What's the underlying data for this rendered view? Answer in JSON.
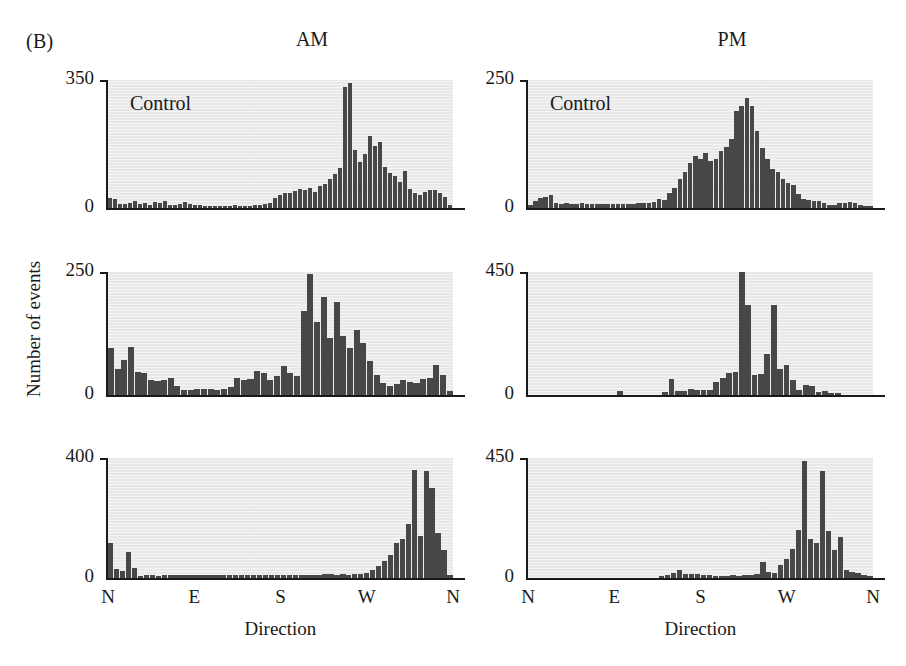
{
  "figure": {
    "panel_letter": "(B)",
    "y_axis_group_label": "Number of events",
    "columns": [
      {
        "id": "am",
        "label": "AM"
      },
      {
        "id": "pm",
        "label": "PM"
      }
    ]
  },
  "chart_data": [
    {
      "id": "am-control",
      "type": "bar",
      "title": "AM",
      "annotation": "Control",
      "xlabel": "Direction",
      "ylabel": "Number of events",
      "ylim": [
        0,
        350
      ],
      "ytick_labels": [
        "0",
        "350"
      ],
      "xtick_labels": [
        "N",
        "E",
        "S",
        "W",
        "N"
      ],
      "grid": false,
      "legend": "none",
      "categories": [
        "N",
        "",
        "",
        "",
        "",
        "",
        "",
        "",
        "E",
        "",
        "",
        "",
        "",
        "",
        "",
        "",
        "S",
        "",
        "",
        "",
        "",
        "",
        "",
        "",
        "W",
        "",
        "",
        "",
        "",
        "",
        "",
        "",
        "N"
      ],
      "values": [
        28,
        26,
        12,
        10,
        14,
        18,
        10,
        13,
        9,
        16,
        14,
        20,
        9,
        8,
        12,
        16,
        11,
        8,
        7,
        6,
        5,
        5,
        5,
        6,
        6,
        7,
        6,
        5,
        6,
        7,
        8,
        10,
        14,
        28,
        36,
        40,
        42,
        46,
        52,
        48,
        56,
        44,
        60,
        66,
        78,
        92,
        110,
        330,
        342,
        160,
        126,
        148,
        196,
        170,
        180,
        112,
        96,
        88,
        70,
        100,
        52,
        40,
        36,
        44,
        50,
        48,
        42,
        30,
        8
      ]
    },
    {
      "id": "pm-control",
      "type": "bar",
      "title": "PM",
      "annotation": "Control",
      "xlabel": "Direction",
      "ylabel": "Number of events",
      "ylim": [
        0,
        250
      ],
      "ytick_labels": [
        "0",
        "250"
      ],
      "xtick_labels": [
        "N",
        "E",
        "S",
        "W",
        "N"
      ],
      "grid": false,
      "legend": "none",
      "categories": [
        "N",
        "",
        "",
        "",
        "",
        "",
        "",
        "",
        "E",
        "",
        "",
        "",
        "",
        "",
        "",
        "",
        "S",
        "",
        "",
        "",
        "",
        "",
        "",
        "",
        "W",
        "",
        "",
        "",
        "",
        "",
        "",
        "",
        "N"
      ],
      "values": [
        6,
        14,
        20,
        22,
        26,
        10,
        8,
        9,
        8,
        8,
        9,
        8,
        7,
        8,
        7,
        8,
        8,
        7,
        8,
        8,
        8,
        9,
        10,
        10,
        12,
        18,
        16,
        30,
        40,
        56,
        70,
        88,
        102,
        96,
        108,
        92,
        96,
        112,
        120,
        134,
        190,
        200,
        215,
        200,
        150,
        118,
        96,
        76,
        70,
        56,
        48,
        44,
        28,
        18,
        16,
        14,
        13,
        10,
        6,
        5,
        10,
        9,
        12,
        10,
        5,
        4,
        3
      ]
    },
    {
      "id": "am-row2",
      "type": "bar",
      "title": "",
      "annotation": "",
      "xlabel": "Direction",
      "ylabel": "Number of events",
      "ylim": [
        0,
        250
      ],
      "ytick_labels": [
        "0",
        "250"
      ],
      "xtick_labels": [
        "N",
        "E",
        "S",
        "W",
        "N"
      ],
      "grid": false,
      "legend": "none",
      "categories": [
        "N",
        "",
        "",
        "",
        "",
        "",
        "",
        "",
        "E",
        "",
        "",
        "",
        "",
        "",
        "",
        "",
        "S",
        "",
        "",
        "",
        "",
        "",
        "",
        "",
        "W",
        "",
        "",
        "",
        "",
        "",
        "",
        "",
        "N"
      ],
      "values": [
        95,
        52,
        72,
        98,
        46,
        44,
        30,
        28,
        30,
        34,
        18,
        10,
        10,
        12,
        12,
        12,
        10,
        12,
        16,
        34,
        30,
        32,
        48,
        44,
        30,
        38,
        58,
        44,
        38,
        170,
        245,
        148,
        200,
        116,
        190,
        120,
        96,
        132,
        106,
        70,
        40,
        24,
        18,
        22,
        30,
        26,
        24,
        32,
        34,
        62,
        40,
        8
      ]
    },
    {
      "id": "pm-row2",
      "type": "bar",
      "title": "",
      "annotation": "",
      "xlabel": "Direction",
      "ylabel": "Number of events",
      "ylim": [
        0,
        450
      ],
      "ytick_labels": [
        "0",
        "450"
      ],
      "xtick_labels": [
        "N",
        "E",
        "S",
        "W",
        "N"
      ],
      "grid": false,
      "legend": "none",
      "categories": [
        "N",
        "",
        "",
        "",
        "",
        "",
        "",
        "",
        "E",
        "",
        "",
        "",
        "",
        "",
        "",
        "",
        "S",
        "",
        "",
        "",
        "",
        "",
        "",
        "",
        "W",
        "",
        "",
        "",
        "",
        "",
        "",
        "",
        "N"
      ],
      "values": [
        0,
        0,
        0,
        0,
        0,
        0,
        0,
        0,
        0,
        0,
        0,
        0,
        0,
        0,
        14,
        0,
        0,
        0,
        0,
        0,
        0,
        10,
        60,
        16,
        14,
        22,
        20,
        20,
        20,
        48,
        62,
        80,
        84,
        450,
        330,
        72,
        76,
        150,
        330,
        94,
        110,
        54,
        20,
        38,
        34,
        12,
        16,
        8,
        6,
        0,
        0,
        0,
        0,
        0
      ]
    },
    {
      "id": "am-row3",
      "type": "bar",
      "title": "",
      "annotation": "",
      "xlabel": "Direction",
      "ylabel": "Number of events",
      "ylim": [
        0,
        400
      ],
      "ytick_labels": [
        "0",
        "400"
      ],
      "xtick_labels": [
        "N",
        "E",
        "S",
        "W",
        "N"
      ],
      "grid": false,
      "legend": "none",
      "categories": [
        "N",
        "",
        "",
        "",
        "",
        "",
        "",
        "",
        "E",
        "",
        "",
        "",
        "",
        "",
        "",
        "",
        "S",
        "",
        "",
        "",
        "",
        "",
        "",
        "",
        "W",
        "",
        "",
        "",
        "",
        "",
        "",
        "",
        "N"
      ],
      "values": [
        118,
        30,
        22,
        88,
        34,
        8,
        10,
        10,
        8,
        10,
        9,
        10,
        9,
        10,
        9,
        9,
        10,
        10,
        10,
        10,
        9,
        10,
        9,
        10,
        10,
        9,
        10,
        10,
        10,
        10,
        10,
        10,
        10,
        10,
        10,
        10,
        12,
        12,
        10,
        14,
        10,
        12,
        14,
        18,
        26,
        40,
        56,
        78,
        116,
        130,
        180,
        360,
        140,
        356,
        300,
        150,
        94,
        10
      ]
    },
    {
      "id": "pm-row3",
      "type": "bar",
      "title": "",
      "annotation": "",
      "xlabel": "Direction",
      "ylabel": "Number of events",
      "ylim": [
        0,
        450
      ],
      "ytick_labels": [
        "0",
        "450"
      ],
      "xtick_labels": [
        "N",
        "E",
        "S",
        "W",
        "N"
      ],
      "grid": false,
      "legend": "none",
      "categories": [
        "N",
        "",
        "",
        "",
        "",
        "",
        "",
        "",
        "E",
        "",
        "",
        "",
        "",
        "",
        "",
        "",
        "S",
        "",
        "",
        "",
        "",
        "",
        "",
        "",
        "W",
        "",
        "",
        "",
        "",
        "",
        "",
        "",
        "N"
      ],
      "values": [
        0,
        0,
        0,
        0,
        0,
        0,
        0,
        0,
        0,
        0,
        0,
        0,
        0,
        0,
        0,
        0,
        0,
        0,
        0,
        0,
        0,
        0,
        6,
        12,
        20,
        30,
        16,
        14,
        14,
        10,
        10,
        8,
        8,
        8,
        10,
        8,
        12,
        10,
        14,
        60,
        24,
        20,
        50,
        70,
        110,
        180,
        440,
        145,
        130,
        400,
        175,
        105,
        155,
        30,
        24,
        20,
        10,
        6
      ]
    }
  ],
  "panels": [
    {
      "id": "am-control",
      "column": "am",
      "row": 1,
      "annotation": "Control",
      "y_max_label": "350"
    },
    {
      "id": "pm-control",
      "column": "pm",
      "row": 1,
      "annotation": "Control",
      "y_max_label": "250"
    },
    {
      "id": "am-row2",
      "column": "am",
      "row": 2,
      "annotation": "",
      "y_max_label": "250"
    },
    {
      "id": "pm-row2",
      "column": "pm",
      "row": 2,
      "annotation": "",
      "y_max_label": "450"
    },
    {
      "id": "am-row3",
      "column": "am",
      "row": 3,
      "annotation": "",
      "y_max_label": "400"
    },
    {
      "id": "pm-row3",
      "column": "pm",
      "row": 3,
      "annotation": "",
      "y_max_label": "450"
    }
  ],
  "axes": {
    "x_tick_labels": [
      "N",
      "E",
      "S",
      "W",
      "N"
    ],
    "x_axis_title": "Direction"
  },
  "colors": {
    "bar": "#474747",
    "plot_background": "#e8e8e8",
    "axis": "#1a1a1a",
    "page_background": "#ffffff"
  }
}
